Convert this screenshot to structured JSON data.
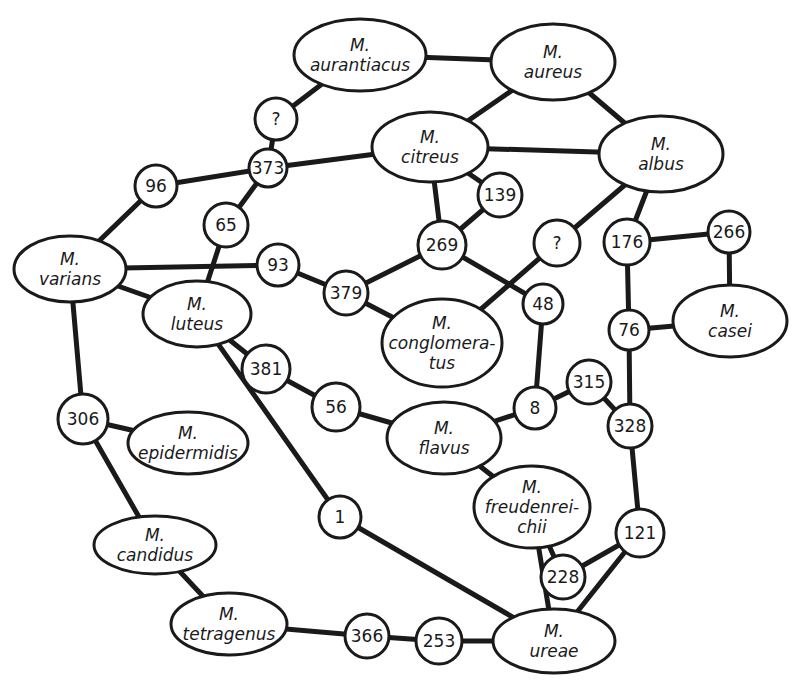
{
  "diagram": {
    "type": "relationship-network",
    "colors": {
      "stroke": "#1a1a1a",
      "background": "#ffffff",
      "node_fill": "#ffffff"
    },
    "species_nodes": [
      {
        "id": "aurantiacus",
        "lines": [
          "M.",
          "aurantiacus"
        ],
        "cx": 360,
        "cy": 55,
        "rx": 66,
        "ry": 36
      },
      {
        "id": "aureus",
        "lines": [
          "M.",
          "aureus"
        ],
        "cx": 553,
        "cy": 62,
        "rx": 62,
        "ry": 38
      },
      {
        "id": "citreus",
        "lines": [
          "M.",
          "citreus"
        ],
        "cx": 430,
        "cy": 147,
        "rx": 58,
        "ry": 35
      },
      {
        "id": "albus",
        "lines": [
          "M.",
          "albus"
        ],
        "cx": 661,
        "cy": 154,
        "rx": 62,
        "ry": 38
      },
      {
        "id": "varians",
        "lines": [
          "M.",
          "varians"
        ],
        "cx": 70,
        "cy": 269,
        "rx": 56,
        "ry": 33
      },
      {
        "id": "luteus",
        "lines": [
          "M.",
          "luteus"
        ],
        "cx": 197,
        "cy": 314,
        "rx": 54,
        "ry": 33
      },
      {
        "id": "conglomeratus",
        "lines": [
          "M.",
          "conglomera-",
          "tus"
        ],
        "cx": 442,
        "cy": 343,
        "rx": 60,
        "ry": 44
      },
      {
        "id": "casei",
        "lines": [
          "M.",
          "casei"
        ],
        "cx": 730,
        "cy": 321,
        "rx": 57,
        "ry": 36
      },
      {
        "id": "epidermidis",
        "lines": [
          "M.",
          "epidermidis"
        ],
        "cx": 188,
        "cy": 443,
        "rx": 60,
        "ry": 31
      },
      {
        "id": "flavus",
        "lines": [
          "M.",
          "flavus"
        ],
        "cx": 444,
        "cy": 438,
        "rx": 57,
        "ry": 36
      },
      {
        "id": "freudenreichii",
        "lines": [
          "M.",
          "freudenrei-",
          "chii"
        ],
        "cx": 532,
        "cy": 507,
        "rx": 58,
        "ry": 41
      },
      {
        "id": "candidus",
        "lines": [
          "M.",
          "candidus"
        ],
        "cx": 155,
        "cy": 545,
        "rx": 61,
        "ry": 29
      },
      {
        "id": "tetragenus",
        "lines": [
          "M.",
          "tetragenus"
        ],
        "cx": 229,
        "cy": 624,
        "rx": 58,
        "ry": 31
      },
      {
        "id": "ureae",
        "lines": [
          "M.",
          "ureae"
        ],
        "cx": 554,
        "cy": 641,
        "rx": 61,
        "ry": 32
      }
    ],
    "number_nodes": [
      {
        "id": "q1",
        "label": "?",
        "cx": 276,
        "cy": 119,
        "r": 21
      },
      {
        "id": "n373",
        "label": "373",
        "cx": 268,
        "cy": 168,
        "r": 19
      },
      {
        "id": "n96",
        "label": "96",
        "cx": 156,
        "cy": 186,
        "r": 21
      },
      {
        "id": "n65",
        "label": "65",
        "cx": 226,
        "cy": 225,
        "r": 22
      },
      {
        "id": "n139",
        "label": "139",
        "cx": 500,
        "cy": 195,
        "r": 22
      },
      {
        "id": "n269",
        "label": "269",
        "cx": 442,
        "cy": 245,
        "r": 24
      },
      {
        "id": "q2",
        "label": "?",
        "cx": 557,
        "cy": 243,
        "r": 23
      },
      {
        "id": "n93",
        "label": "93",
        "cx": 278,
        "cy": 265,
        "r": 21
      },
      {
        "id": "n379",
        "label": "379",
        "cx": 346,
        "cy": 293,
        "r": 22
      },
      {
        "id": "n48",
        "label": "48",
        "cx": 543,
        "cy": 304,
        "r": 20
      },
      {
        "id": "n176",
        "label": "176",
        "cx": 627,
        "cy": 242,
        "r": 23
      },
      {
        "id": "n266",
        "label": "266",
        "cx": 729,
        "cy": 232,
        "r": 21
      },
      {
        "id": "n76",
        "label": "76",
        "cx": 629,
        "cy": 330,
        "r": 20
      },
      {
        "id": "n381",
        "label": "381",
        "cx": 266,
        "cy": 369,
        "r": 24
      },
      {
        "id": "n56",
        "label": "56",
        "cx": 336,
        "cy": 407,
        "r": 24
      },
      {
        "id": "n8",
        "label": "8",
        "cx": 535,
        "cy": 408,
        "r": 21
      },
      {
        "id": "n315",
        "label": "315",
        "cx": 589,
        "cy": 382,
        "r": 22
      },
      {
        "id": "n328",
        "label": "328",
        "cx": 630,
        "cy": 426,
        "r": 22
      },
      {
        "id": "n306",
        "label": "306",
        "cx": 83,
        "cy": 419,
        "r": 25
      },
      {
        "id": "n1",
        "label": "1",
        "cx": 340,
        "cy": 517,
        "r": 21
      },
      {
        "id": "n121",
        "label": "121",
        "cx": 640,
        "cy": 533,
        "r": 24
      },
      {
        "id": "n228",
        "label": "228",
        "cx": 563,
        "cy": 577,
        "r": 22
      },
      {
        "id": "n366",
        "label": "366",
        "cx": 367,
        "cy": 636,
        "r": 22
      },
      {
        "id": "n253",
        "label": "253",
        "cx": 439,
        "cy": 641,
        "r": 23
      }
    ],
    "edges": [
      [
        "aurantiacus",
        "aureus"
      ],
      [
        "aurantiacus",
        "q1"
      ],
      [
        "q1",
        "n373"
      ],
      [
        "aureus",
        "citreus"
      ],
      [
        "aureus",
        "albus"
      ],
      [
        "citreus",
        "albus"
      ],
      [
        "citreus",
        "n373"
      ],
      [
        "citreus",
        "n139"
      ],
      [
        "citreus",
        "n269"
      ],
      [
        "n139",
        "n269"
      ],
      [
        "n373",
        "n96"
      ],
      [
        "n373",
        "n65"
      ],
      [
        "n96",
        "varians"
      ],
      [
        "n65",
        "luteus"
      ],
      [
        "varians",
        "n93"
      ],
      [
        "varians",
        "luteus"
      ],
      [
        "varians",
        "n306"
      ],
      [
        "n93",
        "n379"
      ],
      [
        "n379",
        "n269"
      ],
      [
        "n379",
        "conglomeratus"
      ],
      [
        "n269",
        "n48"
      ],
      [
        "albus",
        "q2"
      ],
      [
        "q2",
        "conglomeratus"
      ],
      [
        "albus",
        "n176"
      ],
      [
        "n176",
        "n266"
      ],
      [
        "n266",
        "casei"
      ],
      [
        "n176",
        "n76"
      ],
      [
        "n76",
        "casei"
      ],
      [
        "n76",
        "n328"
      ],
      [
        "n48",
        "n8"
      ],
      [
        "n8",
        "flavus"
      ],
      [
        "n8",
        "n315"
      ],
      [
        "n315",
        "n328"
      ],
      [
        "n328",
        "n121"
      ],
      [
        "luteus",
        "n381"
      ],
      [
        "n381",
        "n56"
      ],
      [
        "n56",
        "flavus"
      ],
      [
        "luteus",
        "n1"
      ],
      [
        "n1",
        "ureae"
      ],
      [
        "flavus",
        "freudenreichii"
      ],
      [
        "freudenreichii",
        "ureae"
      ],
      [
        "freudenreichii",
        "n228"
      ],
      [
        "n228",
        "n121"
      ],
      [
        "n121",
        "ureae"
      ],
      [
        "n306",
        "epidermidis"
      ],
      [
        "n306",
        "candidus"
      ],
      [
        "candidus",
        "tetragenus"
      ],
      [
        "tetragenus",
        "n366"
      ],
      [
        "n366",
        "n253"
      ],
      [
        "n253",
        "ureae"
      ]
    ]
  }
}
